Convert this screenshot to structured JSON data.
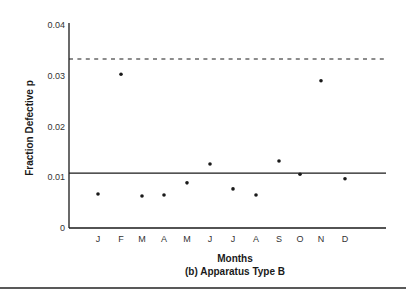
{
  "chart_data": {
    "type": "scatter",
    "title": "(b) Apparatus Type B",
    "xlabel": "Months",
    "ylabel": "Fraction Defective  p",
    "categories": [
      "J",
      "F",
      "M",
      "A",
      "M",
      "J",
      "J",
      "A",
      "S",
      "O",
      "N",
      "D"
    ],
    "values": [
      0.0067,
      0.0303,
      0.0063,
      0.0065,
      0.0089,
      0.0126,
      0.0077,
      0.0065,
      0.0132,
      0.0106,
      0.029,
      0.0097
    ],
    "ylim": [
      0,
      0.04
    ],
    "yticks": [
      "0",
      "0.01",
      "0.02",
      "0.03",
      "0.04"
    ],
    "ytick_values": [
      0,
      0.01,
      0.02,
      0.03,
      0.04
    ],
    "reference_lines": [
      {
        "name": "center-line",
        "value": 0.0108,
        "style": "solid"
      },
      {
        "name": "upper-control-limit",
        "value": 0.0333,
        "style": "dashed"
      }
    ],
    "grid": false,
    "legend": null
  },
  "colors": {
    "ink": "#1a1a1a",
    "background": "#ffffff"
  }
}
